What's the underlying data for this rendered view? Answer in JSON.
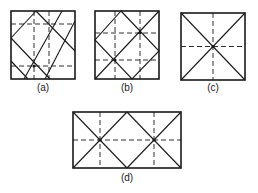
{
  "figure": {
    "type": "fold-pattern diagrams",
    "line_color": "#1a1a1a",
    "background": "#ffffff",
    "legend": {
      "solid_line": "fold / crease line",
      "dashed_line": "center / reference line"
    },
    "panels": [
      {
        "id": "a",
        "label": "(a)",
        "shape": "square",
        "description": "Square with two dashed vertical and two dashed horizontal lines and an oblique diagonal lattice of solid lines"
      },
      {
        "id": "b",
        "label": "(b)",
        "shape": "square",
        "description": "Square with dashed lines at thirds, an inscribed diamond and one main diagonal"
      },
      {
        "id": "c",
        "label": "(c)",
        "shape": "square",
        "description": "Square with both diagonals and dashed center lines crossing at the middle"
      },
      {
        "id": "d",
        "label": "(d)",
        "shape": "rectangle 2:1",
        "description": "Rectangle split into two squares each with crossing diagonals, dashed verticals at quarter points and a dashed horizontal center line"
      }
    ]
  }
}
